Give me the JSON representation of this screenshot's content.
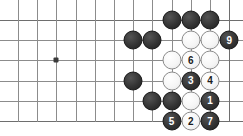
{
  "diagram": {
    "type": "go-board-diagram",
    "board": {
      "columns": 11,
      "rows": 6,
      "cell_size": 19.2,
      "origin_x": 18,
      "origin_y": 20,
      "row_spacing": 20.2,
      "line_color": "#8c8c8c",
      "edge_color": "#6e6e6e",
      "background_color": "#ffffff"
    },
    "colors": {
      "black_stone": "#343434",
      "white_stone": "#fbfbfb",
      "black_label_text": "#ffffff",
      "white_label_text": "#1c1c1c",
      "star_point": "#3a3a3a"
    },
    "star_points": [
      {
        "col": 2,
        "row": 2,
        "name": "hoshi-point"
      }
    ],
    "stones": [
      {
        "id": "black-top-1",
        "color": "black",
        "col": 8,
        "row": 0,
        "label": ""
      },
      {
        "id": "black-top-2",
        "color": "black",
        "col": 9,
        "row": 0,
        "label": ""
      },
      {
        "id": "black-top-3",
        "color": "black",
        "col": 10,
        "row": 0,
        "label": ""
      },
      {
        "id": "black-r1-1",
        "color": "black",
        "col": 6,
        "row": 1,
        "label": ""
      },
      {
        "id": "black-r1-2",
        "color": "black",
        "col": 7,
        "row": 1,
        "label": ""
      },
      {
        "id": "white-r1-1",
        "color": "white",
        "col": 9,
        "row": 1,
        "label": ""
      },
      {
        "id": "white-r1-2",
        "color": "white",
        "col": 10,
        "row": 1,
        "label": ""
      },
      {
        "id": "move-9",
        "color": "black",
        "col": 11,
        "row": 1,
        "label": "9"
      },
      {
        "id": "white-r2-1",
        "color": "white",
        "col": 8,
        "row": 2,
        "label": ""
      },
      {
        "id": "move-6",
        "color": "white",
        "col": 9,
        "row": 2,
        "label": "6"
      },
      {
        "id": "white-r2-2",
        "color": "white",
        "col": 10,
        "row": 2,
        "label": ""
      },
      {
        "id": "black-r3-1",
        "color": "black",
        "col": 6,
        "row": 3,
        "label": ""
      },
      {
        "id": "white-r3-1",
        "color": "white",
        "col": 8,
        "row": 3,
        "label": ""
      },
      {
        "id": "move-3",
        "color": "black",
        "col": 9,
        "row": 3,
        "label": "3"
      },
      {
        "id": "move-4",
        "color": "white",
        "col": 10,
        "row": 3,
        "label": "4"
      },
      {
        "id": "black-r4-1",
        "color": "black",
        "col": 7,
        "row": 4,
        "label": ""
      },
      {
        "id": "black-r4-2",
        "color": "black",
        "col": 8,
        "row": 4,
        "label": ""
      },
      {
        "id": "white-r4-1",
        "color": "white",
        "col": 9,
        "row": 4,
        "label": ""
      },
      {
        "id": "move-1",
        "color": "black",
        "col": 10,
        "row": 4,
        "label": "1"
      },
      {
        "id": "move-5",
        "color": "black",
        "col": 8,
        "row": 5,
        "label": "5"
      },
      {
        "id": "move-2",
        "color": "white",
        "col": 9,
        "row": 5,
        "label": "2"
      },
      {
        "id": "move-7",
        "color": "black",
        "col": 10,
        "row": 5,
        "label": "7"
      }
    ],
    "move_sequence": [
      {
        "number": "1",
        "color": "black"
      },
      {
        "number": "2",
        "color": "white"
      },
      {
        "number": "3",
        "color": "black"
      },
      {
        "number": "4",
        "color": "white"
      },
      {
        "number": "5",
        "color": "black"
      },
      {
        "number": "6",
        "color": "white"
      },
      {
        "number": "7",
        "color": "black"
      },
      {
        "number": "9",
        "color": "black"
      }
    ]
  }
}
